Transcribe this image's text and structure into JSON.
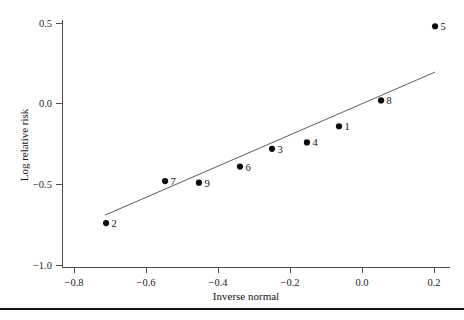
{
  "chart_data": {
    "type": "scatter",
    "title": "",
    "xlabel": "Inverse normal",
    "ylabel": "Log relative risk",
    "xlim": [
      -0.88,
      0.24
    ],
    "ylim": [
      -1.08,
      0.58
    ],
    "xticks": [
      -0.8,
      -0.6,
      -0.4,
      -0.2,
      0.0,
      0.2
    ],
    "xtick_labels": [
      "−0.8",
      "−0.6",
      "−0.4",
      "−0.2",
      "0.0",
      "0.2"
    ],
    "yticks": [
      0.5,
      0.0,
      -0.5,
      -1.0
    ],
    "ytick_labels": [
      "0.5",
      "0.0",
      "−0.5",
      "−1.0"
    ],
    "grid": false,
    "legend": "none",
    "points": [
      {
        "label": "1",
        "x": -0.064,
        "y": -0.14
      },
      {
        "label": "2",
        "x": -0.711,
        "y": -0.74
      },
      {
        "label": "3",
        "x": -0.25,
        "y": -0.28
      },
      {
        "label": "4",
        "x": -0.153,
        "y": -0.24
      },
      {
        "label": "5",
        "x": 0.203,
        "y": 0.48
      },
      {
        "label": "6",
        "x": -0.339,
        "y": -0.39
      },
      {
        "label": "7",
        "x": -0.547,
        "y": -0.48
      },
      {
        "label": "8",
        "x": 0.053,
        "y": 0.02
      },
      {
        "label": "9",
        "x": -0.453,
        "y": -0.49
      }
    ],
    "fit_line": {
      "name": "reference line",
      "x_start": -0.714,
      "y_start": -0.691,
      "x_end": 0.203,
      "y_end": 0.196
    },
    "marker_color": "#0b0b0b",
    "line_color": "#4a4a4a",
    "axis_color": "#3a3a3a",
    "background_color": "#ffffff"
  },
  "footer": {
    "rule_color": "#151515"
  }
}
